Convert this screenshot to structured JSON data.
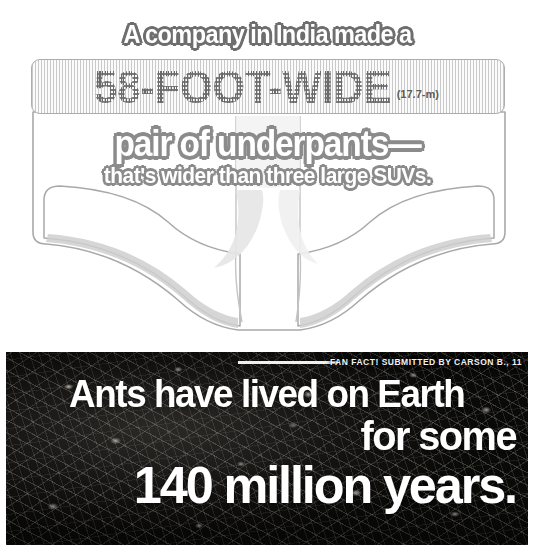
{
  "underpants_fact": {
    "headline_top": "A company in India made a",
    "measure_feet": "58-FOOT-WIDE",
    "measure_metric": "(17.7-m)",
    "headline_mid": "pair of underpants—",
    "headline_sub": "that's wider than three large SUVs.",
    "illustration": "giant-briefs-illustration",
    "colors": {
      "outline": "#a9a9a9",
      "fill": "#ffffff",
      "shadow": "#d8d8d8",
      "text_stroke": "#8b8b8b"
    }
  },
  "ants_fact": {
    "credit": "FAN FACT! SUBMITTED BY CARSON B., 11",
    "line_1": "Ants have lived on Earth",
    "line_2": "for some",
    "line_3": "140 million years.",
    "photo": "ant-colony-photo",
    "colors": {
      "text": "#ffffff",
      "background": "#101010"
    }
  }
}
